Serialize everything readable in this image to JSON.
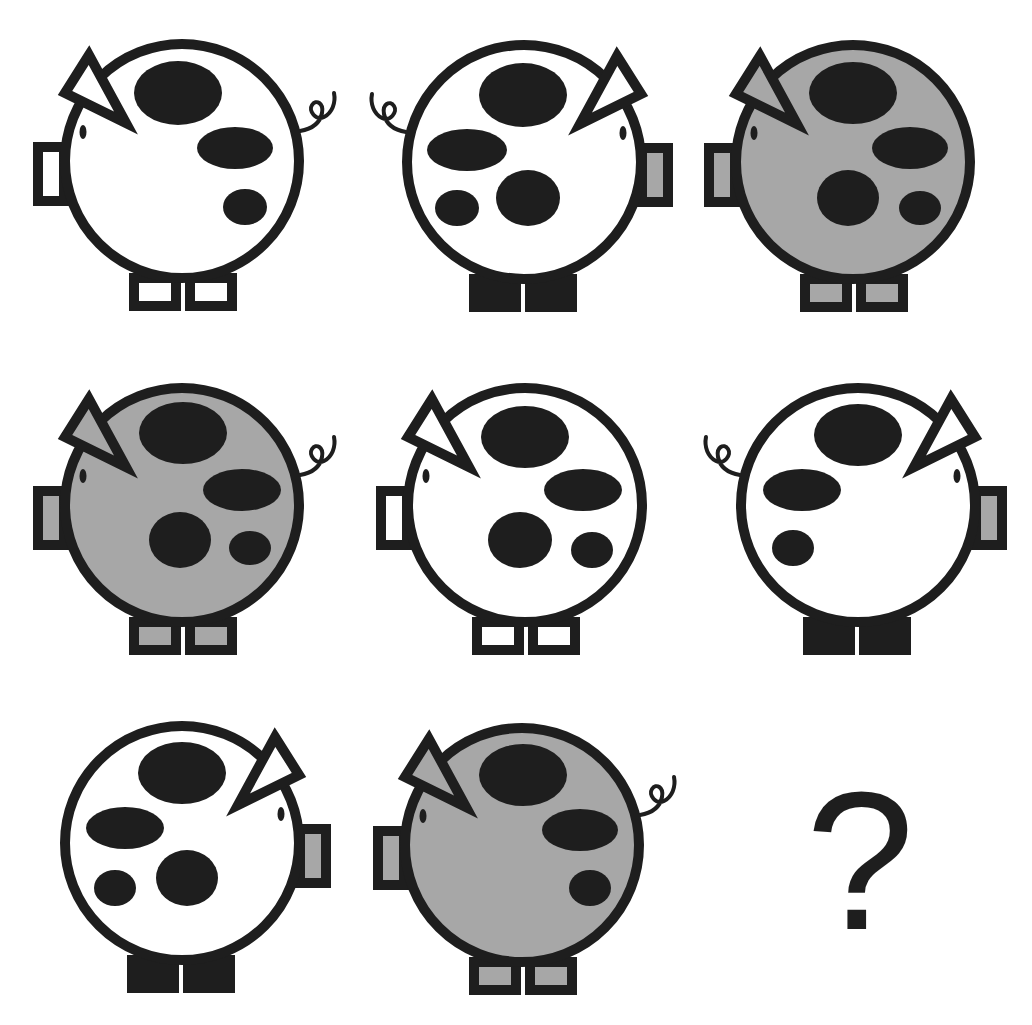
{
  "puzzle": {
    "type": "3x3 matrix reasoning",
    "colors": {
      "outline": "#1e1e1e",
      "gray": "#a7a7a7",
      "white": "#ffffff",
      "spot": "#1e1e1e"
    },
    "answer_placeholder": "?",
    "cells": [
      {
        "row": 0,
        "col": 0,
        "cx": 182,
        "cy": 161,
        "facing": "left",
        "body": "white",
        "tail": true,
        "feet": "outlined",
        "snout_inner": "white",
        "spots": [
          {
            "x": 178,
            "y": 93,
            "rx": 44,
            "ry": 32
          },
          {
            "x": 235,
            "y": 148,
            "rx": 38,
            "ry": 21
          },
          {
            "x": 245,
            "y": 207,
            "rx": 22,
            "ry": 18
          }
        ]
      },
      {
        "row": 0,
        "col": 1,
        "cx": 524,
        "cy": 162,
        "facing": "right",
        "body": "white",
        "tail": true,
        "feet": "solid",
        "snout_inner": "gray",
        "spots": [
          {
            "x": 523,
            "y": 95,
            "rx": 44,
            "ry": 32
          },
          {
            "x": 467,
            "y": 150,
            "rx": 40,
            "ry": 21
          },
          {
            "x": 457,
            "y": 208,
            "rx": 22,
            "ry": 18
          },
          {
            "x": 528,
            "y": 198,
            "rx": 32,
            "ry": 28
          }
        ]
      },
      {
        "row": 0,
        "col": 2,
        "cx": 853,
        "cy": 162,
        "facing": "left",
        "body": "gray",
        "tail": false,
        "feet": "outlined",
        "snout_inner": "gray",
        "spots": [
          {
            "x": 853,
            "y": 93,
            "rx": 44,
            "ry": 31
          },
          {
            "x": 910,
            "y": 148,
            "rx": 38,
            "ry": 21
          },
          {
            "x": 848,
            "y": 198,
            "rx": 31,
            "ry": 28
          },
          {
            "x": 920,
            "y": 208,
            "rx": 21,
            "ry": 17
          }
        ]
      },
      {
        "row": 1,
        "col": 0,
        "cx": 182,
        "cy": 505,
        "facing": "left",
        "body": "gray",
        "tail": true,
        "feet": "outlined",
        "snout_inner": "gray",
        "spots": [
          {
            "x": 183,
            "y": 433,
            "rx": 44,
            "ry": 31
          },
          {
            "x": 242,
            "y": 490,
            "rx": 39,
            "ry": 21
          },
          {
            "x": 180,
            "y": 540,
            "rx": 31,
            "ry": 28
          },
          {
            "x": 250,
            "y": 548,
            "rx": 21,
            "ry": 17
          }
        ]
      },
      {
        "row": 1,
        "col": 1,
        "cx": 525,
        "cy": 505,
        "facing": "left",
        "body": "white",
        "tail": false,
        "feet": "outlined",
        "snout_inner": "white",
        "spots": [
          {
            "x": 525,
            "y": 437,
            "rx": 44,
            "ry": 31
          },
          {
            "x": 583,
            "y": 490,
            "rx": 39,
            "ry": 21
          },
          {
            "x": 520,
            "y": 540,
            "rx": 32,
            "ry": 28
          },
          {
            "x": 592,
            "y": 550,
            "rx": 21,
            "ry": 18
          }
        ]
      },
      {
        "row": 1,
        "col": 2,
        "cx": 858,
        "cy": 505,
        "facing": "right",
        "body": "white",
        "tail": true,
        "feet": "solid",
        "snout_inner": "gray",
        "spots": [
          {
            "x": 858,
            "y": 435,
            "rx": 44,
            "ry": 31
          },
          {
            "x": 802,
            "y": 490,
            "rx": 39,
            "ry": 21
          },
          {
            "x": 793,
            "y": 548,
            "rx": 21,
            "ry": 18
          }
        ]
      },
      {
        "row": 2,
        "col": 0,
        "cx": 182,
        "cy": 843,
        "facing": "right",
        "body": "white",
        "tail": false,
        "feet": "solid",
        "snout_inner": "gray",
        "spots": [
          {
            "x": 182,
            "y": 773,
            "rx": 44,
            "ry": 31
          },
          {
            "x": 125,
            "y": 828,
            "rx": 39,
            "ry": 21
          },
          {
            "x": 115,
            "y": 888,
            "rx": 21,
            "ry": 18
          },
          {
            "x": 187,
            "y": 878,
            "rx": 31,
            "ry": 28
          }
        ]
      },
      {
        "row": 2,
        "col": 1,
        "cx": 522,
        "cy": 845,
        "facing": "left",
        "body": "gray",
        "tail": true,
        "feet": "outlined",
        "snout_inner": "gray",
        "spots": [
          {
            "x": 523,
            "y": 775,
            "rx": 44,
            "ry": 31
          },
          {
            "x": 580,
            "y": 830,
            "rx": 38,
            "ry": 21
          },
          {
            "x": 590,
            "y": 888,
            "rx": 21,
            "ry": 18
          }
        ]
      }
    ]
  }
}
